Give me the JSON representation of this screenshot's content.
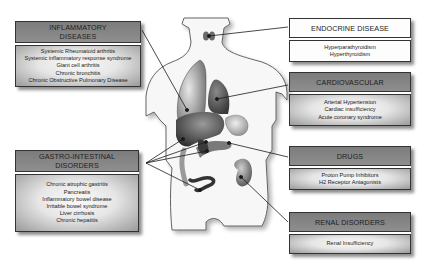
{
  "diagram": {
    "type": "anatomical-callout-diagram"
  },
  "boxes": {
    "inflammatory": {
      "title_line1": "INFLAMMATORY",
      "title_line2": "DISEASES",
      "items": [
        "Systemic Rheumatoid arthritis",
        "Systemic inflammatory response syndrome",
        "Giant cell arthritis",
        "Chronic bronchitis",
        "Chronic Obstructive Pulmonary Disease"
      ]
    },
    "gastro": {
      "title_line1": "GASTRO-INTESTINAL",
      "title_line2": "DISORDERS",
      "items": [
        "Chronic atrophic gastritis",
        "Pancreatis",
        "Inflammatory bowel disease",
        "Irritable bowel syndrome",
        "Liver cirrhosis",
        "Chronic hepatitis"
      ]
    },
    "endocrine": {
      "title": "ENDOCRINE DISEASE",
      "items": [
        "Hyperparathyroidism",
        "Hyperthyroidism"
      ]
    },
    "cardiovascular": {
      "title": "CARDIOVASCULAR",
      "items": [
        "Arterial Hypertension",
        "Cardiac insufficiency",
        "Acute coronary syndrome"
      ]
    },
    "drugs": {
      "title": "DRUGS",
      "items": [
        "Proton Pump Inhibitors",
        "H2 Receptor Antagonists"
      ]
    },
    "renal": {
      "title": "RENAL DISORDERS",
      "items": [
        "Renal Insufficiency"
      ]
    }
  },
  "colors": {
    "header_dark": "#858585",
    "header_light": "#fdfdfd",
    "border": "#333333",
    "organ_dark": "#3a3a3a",
    "organ_mid": "#7a7a7a",
    "organ_light": "#c8c8c8",
    "body_fill": "#f7f7f7"
  }
}
